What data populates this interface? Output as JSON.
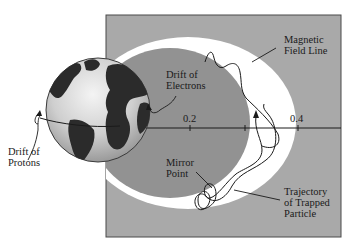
{
  "diagram": {
    "colors": {
      "background": "#ffffff",
      "panel": "#a9a9a9",
      "panel_border": "#4a4a4a",
      "inner_region": "#8e8e8e",
      "radiation_belt": "#ffffff",
      "earth_ocean": "#d6d6d6",
      "earth_land": "#2b2b2b",
      "line": "#1a1a1a"
    },
    "labels": {
      "magnetic_field_line": [
        "Magnetic",
        "Field Line"
      ],
      "drift_of_electrons": [
        "Drift of",
        "Electrons"
      ],
      "drift_of_protons": [
        "Drift of",
        "Protons"
      ],
      "mirror_point": [
        "Mirror",
        "Point"
      ],
      "trajectory": [
        "Trajectory",
        "of Trapped",
        "Particle"
      ]
    },
    "axis": {
      "ticks": [
        "0.2",
        "0.4"
      ]
    }
  }
}
